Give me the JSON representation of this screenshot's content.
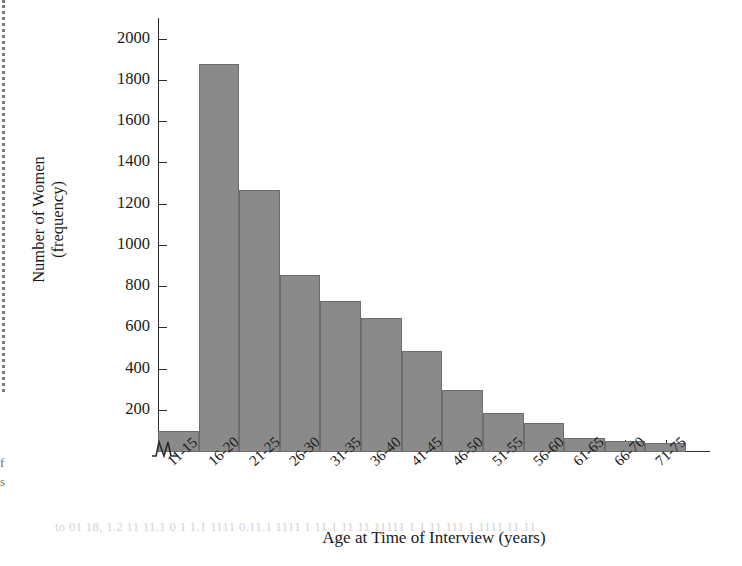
{
  "chart_data": {
    "type": "bar",
    "title": "",
    "subtitle": "",
    "xlabel": "Age at Time of Interview (years)",
    "ylabel": "Number of Women\n(frequency)",
    "ylabel_line1": "Number of Women",
    "ylabel_line2": "(frequency)",
    "categories": [
      "11-15",
      "16-20",
      "21-25",
      "26-30",
      "31-35",
      "36-40",
      "41-45",
      "46-50",
      "51-55",
      "56-60",
      "61-65",
      "66-70",
      "71-75"
    ],
    "values": [
      100,
      1880,
      1270,
      860,
      730,
      650,
      490,
      300,
      190,
      140,
      70,
      55,
      45
    ],
    "ylim": [
      0,
      2100
    ],
    "yticks": [
      200,
      400,
      600,
      800,
      1000,
      1200,
      1400,
      1600,
      1800,
      2000
    ],
    "ytick_labels": [
      "200",
      "400",
      "600",
      "800",
      "1000",
      "1200",
      "1400",
      "1600",
      "1800",
      "2000"
    ],
    "grid": false,
    "legend": false,
    "legend_position": "none",
    "axis_break_y": true,
    "bar_fill_color": "#8a8a8a",
    "bar_edge_color": "#6d6d6d",
    "axis_color": "#2b2b2b"
  },
  "page": {
    "margin_fragment_top": "f",
    "margin_fragment_bottom": "s",
    "showthrough_text": "to 01 18, 1.2 11 11.1 0 1 1.1 1111 0.11.1 1111 1 11 1 11 11 11111 1 1 11 111 1 1111 11 11"
  }
}
